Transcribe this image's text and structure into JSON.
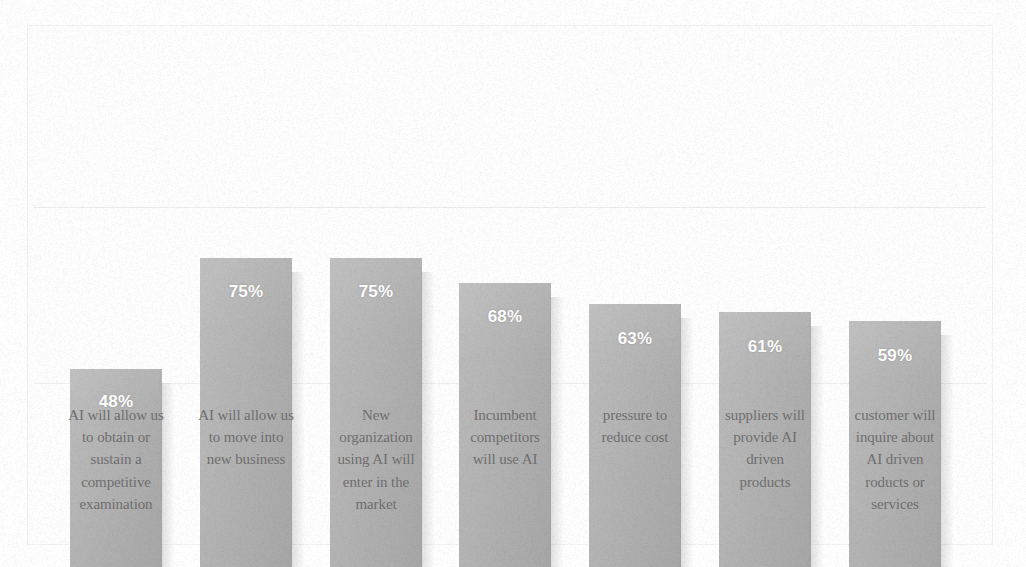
{
  "chart_data": {
    "type": "bar",
    "title": "",
    "subtitle": "",
    "xlabel": "",
    "ylabel": "",
    "ylim": [
      0,
      100
    ],
    "grid": "single faint horizontal gridline near 50%",
    "legend": "none",
    "value_label_suffix": "%",
    "value_label_position": "inside-top",
    "bar_color": "#b6b6b6",
    "value_label_color": "#ffffff",
    "background_color": "#ffffff",
    "frame_color": "#f2f2f2",
    "categories": [
      "AI will allow us to obtain or sustain a competitive examination",
      "AI will allow us to move into new business",
      "New organization using AI will enter in the market",
      "Incumbent competitors will use AI",
      "pressure to reduce cost",
      "suppliers will provide AI driven products",
      "customer will inquire about AI driven roducts or services"
    ],
    "category_lines": [
      [
        "AI will allow us",
        "to obtain or",
        "sustain a",
        "competitive",
        "examination"
      ],
      [
        "AI will allow us",
        "to move into",
        "new business"
      ],
      [
        "New",
        "organization",
        "using AI will",
        "enter in the",
        "market"
      ],
      [
        "Incumbent",
        "competitors",
        "will use AI"
      ],
      [
        "pressure to",
        "reduce cost"
      ],
      [
        "suppliers will",
        "provide AI",
        "driven",
        "products"
      ],
      [
        "customer will",
        "inquire about",
        "AI driven",
        "roducts or",
        "services"
      ]
    ],
    "values": [
      48,
      75,
      75,
      68,
      63,
      61,
      59
    ],
    "value_labels": [
      "48%",
      "75%",
      "75%",
      "68%",
      "63%",
      "61%",
      "59%"
    ]
  }
}
